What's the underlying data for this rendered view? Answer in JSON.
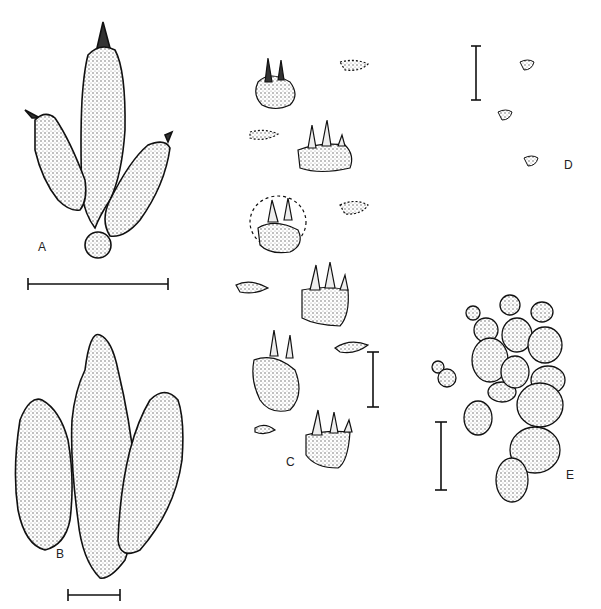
{
  "figure": {
    "panels": [
      {
        "id": "A",
        "label": "A",
        "description": "tridactyl footprint with metatarsal pad, with scale bar"
      },
      {
        "id": "B",
        "label": "B",
        "description": "large tridactyl footprint with phalangeal pads, with scale bar"
      },
      {
        "id": "C",
        "label": "C",
        "description": "trackway of small clawed manus and pes prints, with scale bar"
      },
      {
        "id": "D",
        "label": "D",
        "description": "three tiny footprints with scale bar"
      },
      {
        "id": "E",
        "label": "E",
        "description": "pentadactyl footprint with segmented digit pads, with scale bar"
      }
    ]
  }
}
